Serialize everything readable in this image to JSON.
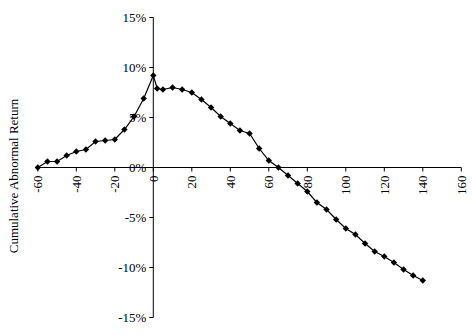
{
  "chart_data": {
    "type": "line",
    "title": "",
    "xlabel": "",
    "ylabel": "Cumulative Abnormal Return",
    "x": [
      -60,
      -55,
      -50,
      -45,
      -40,
      -35,
      -30,
      -25,
      -20,
      -15,
      -10,
      -5,
      0,
      2,
      5,
      10,
      15,
      20,
      25,
      30,
      35,
      40,
      45,
      50,
      55,
      60,
      65,
      70,
      75,
      80,
      85,
      90,
      95,
      100,
      105,
      110,
      115,
      120,
      125,
      130,
      135,
      140
    ],
    "series": [
      {
        "name": "CAR",
        "values": [
          0.0,
          0.6,
          0.6,
          1.2,
          1.6,
          1.8,
          2.6,
          2.7,
          2.8,
          3.8,
          5.1,
          6.9,
          9.2,
          7.9,
          7.8,
          8.0,
          7.8,
          7.5,
          6.8,
          6.0,
          5.1,
          4.4,
          3.7,
          3.4,
          1.9,
          0.7,
          0.0,
          -0.8,
          -1.6,
          -2.4,
          -3.5,
          -4.2,
          -5.2,
          -6.1,
          -6.7,
          -7.6,
          -8.4,
          -8.9,
          -9.5,
          -10.2,
          -10.8,
          -11.3
        ],
        "color": "#000000",
        "marker": "diamond"
      }
    ],
    "xlim": [
      -60,
      160
    ],
    "ylim": [
      -15,
      15
    ],
    "x_ticks": [
      -60,
      -40,
      -20,
      0,
      20,
      40,
      60,
      80,
      100,
      120,
      140,
      160
    ],
    "x_tick_labels": [
      "-60",
      "-40",
      "-20",
      "0",
      "20",
      "40",
      "60",
      "80",
      "100",
      "120",
      "140",
      "160"
    ],
    "y_ticks": [
      15,
      10,
      5,
      0,
      -5,
      -10,
      -15
    ],
    "y_tick_labels": [
      "15%",
      "10%",
      "5%",
      "0%",
      "-5%",
      "-10%",
      "-15%"
    ],
    "grid": false,
    "legend": null
  }
}
